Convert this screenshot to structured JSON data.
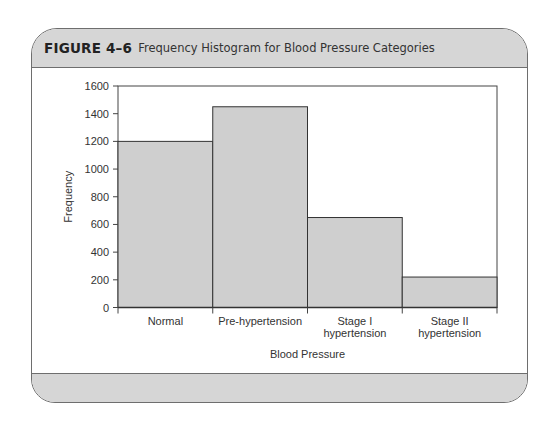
{
  "figure": {
    "label": "FIGURE 4–6",
    "title": "Frequency Histogram for Blood Pressure Categories"
  },
  "colors": {
    "bar_fill": "#cfcfcf",
    "bar_stroke": "#333333",
    "header_bg": "#d6d6d6",
    "frame_stroke": "#6e6e6e"
  },
  "chart_data": {
    "type": "bar",
    "title": "Frequency Histogram for Blood Pressure Categories",
    "xlabel": "Blood Pressure",
    "ylabel": "Frequency",
    "categories": [
      "Normal",
      "Pre-hypertension",
      "Stage I hypertension",
      "Stage II hypertension"
    ],
    "category_lines": [
      [
        "Normal"
      ],
      [
        "Pre-hypertension"
      ],
      [
        "Stage I",
        "hypertension"
      ],
      [
        "Stage II",
        "hypertension"
      ]
    ],
    "values": [
      1200,
      1450,
      650,
      220
    ],
    "ylim": [
      0,
      1600
    ],
    "yticks": [
      0,
      200,
      400,
      600,
      800,
      1000,
      1200,
      1400,
      1600
    ],
    "grid": false,
    "legend": null,
    "bar_gap": 0
  }
}
